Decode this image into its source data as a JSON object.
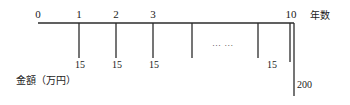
{
  "diagram": {
    "type": "cash-flow-timeline",
    "axis": {
      "start_x": 38,
      "end_x": 294,
      "y": 23,
      "title": "年数",
      "title_x": 310,
      "title_y": 11
    },
    "value_axis_title": "金額（万円）",
    "value_axis_title_x": 16,
    "value_axis_title_y": 76,
    "period_ticks": [
      {
        "label": "0",
        "x": 38,
        "label_x": 38,
        "has_tick": false,
        "depth": 0
      },
      {
        "label": "1",
        "x": 79,
        "label_x": 79,
        "has_tick": true,
        "depth": 35
      },
      {
        "label": "2",
        "x": 116,
        "label_x": 116,
        "has_tick": true,
        "depth": 35
      },
      {
        "label": "3",
        "x": 153,
        "label_x": 153,
        "has_tick": true,
        "depth": 35
      },
      {
        "label": "",
        "x": 192,
        "label_x": 192,
        "has_tick": true,
        "depth": 35
      },
      {
        "label": "",
        "x": 258,
        "label_x": 258,
        "has_tick": true,
        "depth": 35
      },
      {
        "label": "10",
        "x": 291,
        "label_x": 291,
        "has_tick": true,
        "depth": 39
      }
    ],
    "cash_outflows": [
      {
        "value": "15",
        "x": 80,
        "y": 60
      },
      {
        "value": "15",
        "x": 117,
        "y": 60
      },
      {
        "value": "15",
        "x": 154,
        "y": 60
      },
      {
        "value": "15",
        "x": 272,
        "y": 60
      }
    ],
    "ellipsis": {
      "text": "… …",
      "x": 212,
      "y": 39
    },
    "terminal_outflow": {
      "value": "200",
      "x": 297,
      "y": 80,
      "line_x": 294,
      "line_top": 23,
      "line_bottom": 96
    },
    "colors": {
      "line": "#2b2b2b",
      "text": "#1a1a1a",
      "background": "#ffffff"
    }
  }
}
